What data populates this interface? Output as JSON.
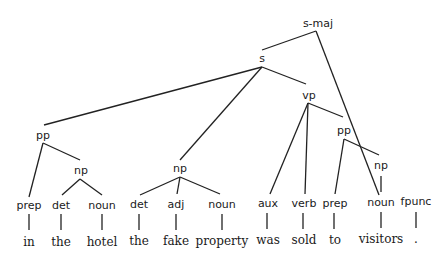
{
  "diagram": {
    "type": "parse-tree",
    "sentence": "in the hotel the fake property was sold to visitors .",
    "nodes": {
      "s_maj": {
        "label": "s-maj"
      },
      "s": {
        "label": "s"
      },
      "pp1": {
        "label": "pp"
      },
      "np1": {
        "label": "np"
      },
      "np2": {
        "label": "np"
      },
      "vp": {
        "label": "vp"
      },
      "pp2": {
        "label": "pp"
      },
      "np3": {
        "label": "np"
      }
    },
    "preterminals": [
      {
        "tag": "prep",
        "word": "in"
      },
      {
        "tag": "det",
        "word": "the"
      },
      {
        "tag": "noun",
        "word": "hotel"
      },
      {
        "tag": "det",
        "word": "the"
      },
      {
        "tag": "adj",
        "word": "fake"
      },
      {
        "tag": "noun",
        "word": "property"
      },
      {
        "tag": "aux",
        "word": "was"
      },
      {
        "tag": "verb",
        "word": "sold"
      },
      {
        "tag": "prep",
        "word": "to"
      },
      {
        "tag": "noun",
        "word": "visitors"
      },
      {
        "tag": "fpunc",
        "word": "."
      }
    ],
    "structure": "(s-maj (s (pp (prep in) (np (det the) (noun hotel))) (np (det the) (adj fake) (noun property)) (vp (aux was) (verb sold) (pp (prep to) (np (noun visitors))))) (fpunc .))"
  }
}
